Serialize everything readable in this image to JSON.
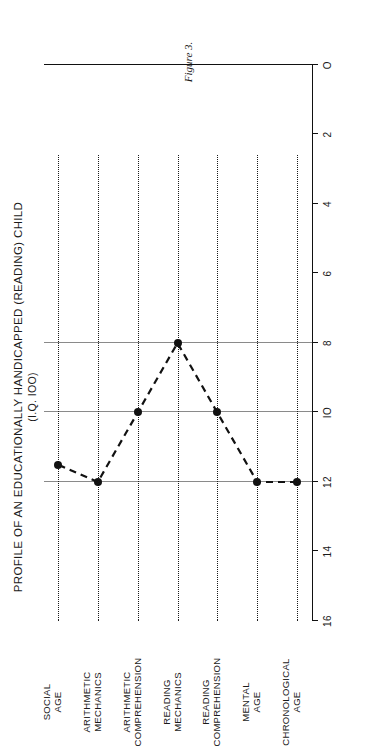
{
  "figure": {
    "title": "PROFILE OF AN EDUCATIONALLY HANDICAPPED (READING) CHILD",
    "subtitle": "(I.Q. IOO)",
    "caption": "Figure 3."
  },
  "chart_data": {
    "type": "line",
    "title": "PROFILE OF AN EDUCATIONALLY HANDICAPPED (READING) CHILD",
    "subtitle": "(I.Q. IOO)",
    "orientation": "horizontal",
    "xlabel": "",
    "ylabel": "",
    "xlim": [
      16,
      0
    ],
    "axis_direction": "descending",
    "grid": "dotted guide line per category; solid vertical gridlines at 12, 10 and 8",
    "legend": "none",
    "tick_labels": [
      "16",
      "14",
      "12",
      "IO",
      "8",
      "6",
      "4",
      "2",
      "O"
    ],
    "tick_values": [
      16,
      14,
      12,
      10,
      8,
      6,
      4,
      2,
      0
    ],
    "major_gridlines": [
      12,
      10,
      8
    ],
    "categories": [
      "CHRONOLOGICAL\nAGE",
      "MENTAL\nAGE",
      "READING\nCOMPREHENSION",
      "READING\nMECHANICS",
      "ARITHMETIC\nCOMPREHENSION",
      "ARITHMETIC\nMECHANICS",
      "SOCIAL\nAGE"
    ],
    "values": [
      12,
      12,
      10,
      8,
      10,
      12,
      11.5
    ],
    "marker": "filled-circle",
    "line_style": "dashed",
    "series": [
      {
        "name": "profile",
        "points": [
          {
            "category": "CHRONOLOGICAL AGE",
            "value": 12
          },
          {
            "category": "MENTAL AGE",
            "value": 12
          },
          {
            "category": "READING COMPREHENSION",
            "value": 10
          },
          {
            "category": "READING MECHANICS",
            "value": 8
          },
          {
            "category": "ARITHMETIC COMPREHENSION",
            "value": 10
          },
          {
            "category": "ARITHMETIC MECHANICS",
            "value": 12
          },
          {
            "category": "SOCIAL AGE",
            "value": 11.5
          }
        ]
      }
    ],
    "colors": {
      "line": "#111111",
      "marker": "#111111",
      "guide": "#1a1a1a",
      "gridline": "#8a8a8a",
      "axis": "#111111",
      "background": "#ffffff"
    }
  }
}
